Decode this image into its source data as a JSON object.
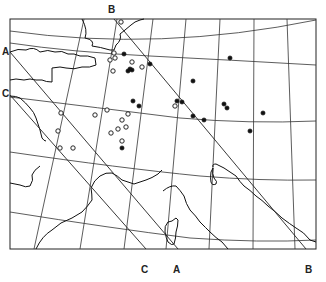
{
  "map": {
    "title": "",
    "frame": {
      "x": 10,
      "y": 10,
      "width": 306,
      "height": 239
    },
    "line_labels": [
      {
        "id": "B-top",
        "text": "B",
        "x": 108,
        "y": 3
      },
      {
        "id": "A-left",
        "text": "A",
        "x": 3,
        "y": 48
      },
      {
        "id": "C-left",
        "text": "C",
        "x": 3,
        "y": 89
      },
      {
        "id": "C-bottom",
        "text": "C",
        "x": 141,
        "y": 263
      },
      {
        "id": "A-bottom",
        "text": "A",
        "x": 173,
        "y": 263
      },
      {
        "id": "B-bottom",
        "text": "B",
        "x": 305,
        "y": 263
      }
    ],
    "trend_lines": [
      {
        "name": "A",
        "x1": 10,
        "y1": 52,
        "x2": 178,
        "y2": 249
      },
      {
        "name": "B",
        "x1": 114,
        "y1": 10,
        "x2": 306,
        "y2": 249
      },
      {
        "name": "C",
        "x1": 10,
        "y1": 96,
        "x2": 146,
        "y2": 249
      }
    ],
    "legend": {
      "open_circle": "site (open symbol)",
      "filled_circle": "site (filled symbol)"
    },
    "sites_open": [
      [
        121,
        22
      ],
      [
        114,
        53
      ],
      [
        115,
        58
      ],
      [
        110,
        60
      ],
      [
        132,
        62
      ],
      [
        142,
        67
      ],
      [
        113,
        71
      ],
      [
        107,
        110
      ],
      [
        95,
        115
      ],
      [
        61,
        113
      ],
      [
        58,
        131
      ],
      [
        60,
        148
      ],
      [
        73,
        148
      ],
      [
        122,
        120
      ],
      [
        128,
        114
      ],
      [
        118,
        129
      ],
      [
        111,
        133
      ],
      [
        126,
        127
      ],
      [
        122,
        141
      ],
      [
        175,
        106
      ]
    ],
    "sites_filled": [
      [
        124,
        54
      ],
      [
        150,
        64
      ],
      [
        132,
        70
      ],
      [
        128,
        71
      ],
      [
        130,
        69
      ],
      [
        133,
        101
      ],
      [
        139,
        106
      ],
      [
        230,
        58
      ],
      [
        193,
        81
      ],
      [
        177,
        101
      ],
      [
        224,
        104
      ],
      [
        227,
        108
      ],
      [
        193,
        116
      ],
      [
        204,
        120
      ],
      [
        263,
        113
      ],
      [
        250,
        131
      ],
      [
        122,
        148
      ],
      [
        182,
        102
      ]
    ]
  }
}
